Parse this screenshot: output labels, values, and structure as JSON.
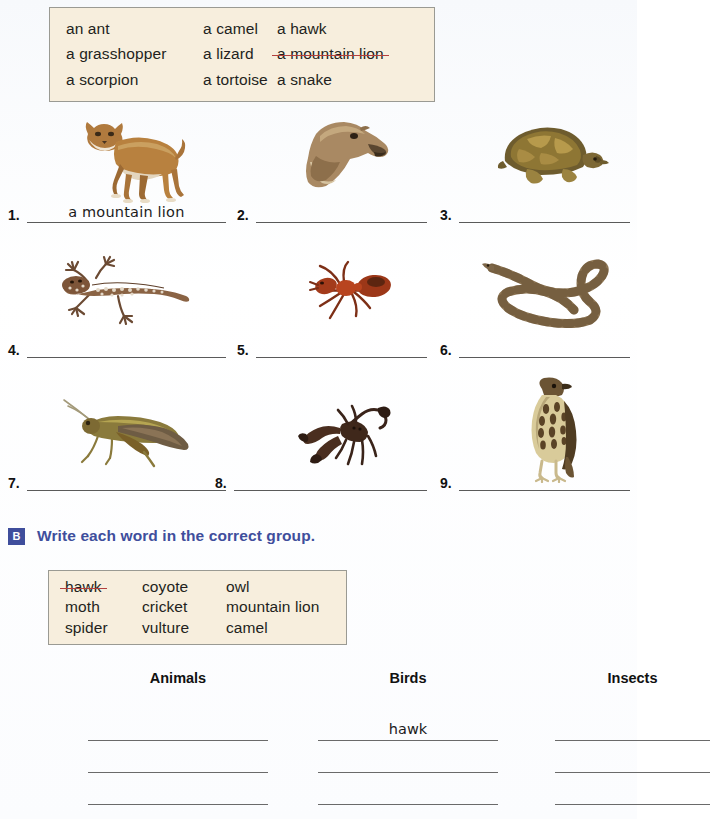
{
  "word_bank_a": {
    "name": "word-bank-a",
    "words": [
      {
        "text": "an ant",
        "struck": false
      },
      {
        "text": "a camel",
        "struck": false
      },
      {
        "text": "a hawk",
        "struck": false
      },
      {
        "text": "a grasshopper",
        "struck": false
      },
      {
        "text": "a lizard",
        "struck": false
      },
      {
        "text": "a mountain lion",
        "struck": true
      },
      {
        "text": "a scorpion",
        "struck": false
      },
      {
        "text": "a tortoise",
        "struck": false
      },
      {
        "text": "a snake",
        "struck": false
      }
    ]
  },
  "picture_items": [
    {
      "number": "1.",
      "animal": "mountain-lion",
      "answer": "a mountain lion"
    },
    {
      "number": "2.",
      "animal": "camel",
      "answer": ""
    },
    {
      "number": "3.",
      "animal": "tortoise",
      "answer": ""
    },
    {
      "number": "4.",
      "animal": "lizard",
      "answer": ""
    },
    {
      "number": "5.",
      "animal": "ant",
      "answer": ""
    },
    {
      "number": "6.",
      "animal": "snake",
      "answer": ""
    },
    {
      "number": "7.",
      "animal": "grasshopper",
      "answer": ""
    },
    {
      "number": "8.",
      "animal": "scorpion",
      "answer": ""
    },
    {
      "number": "9.",
      "animal": "hawk",
      "answer": ""
    }
  ],
  "section_b": {
    "badge": "B",
    "title": "Write each word in the correct group.",
    "word_bank_b": {
      "words": [
        {
          "text": "hawk",
          "struck": true
        },
        {
          "text": "coyote",
          "struck": false
        },
        {
          "text": "owl",
          "struck": false
        },
        {
          "text": "moth",
          "struck": false
        },
        {
          "text": "cricket",
          "struck": false
        },
        {
          "text": "mountain lion",
          "struck": false
        },
        {
          "text": "spider",
          "struck": false
        },
        {
          "text": "vulture",
          "struck": false
        },
        {
          "text": "camel",
          "struck": false
        }
      ]
    },
    "categories": [
      {
        "title": "Animals",
        "answers": [
          "",
          "",
          ""
        ]
      },
      {
        "title": "Birds",
        "answers": [
          "hawk",
          "",
          ""
        ]
      },
      {
        "title": "Insects",
        "answers": [
          "",
          "",
          ""
        ]
      }
    ]
  },
  "colors": {
    "wordbox_bg": "#f7eedd",
    "wordbox_border": "#9a9a93",
    "strike_red": "#b2403f",
    "heading_blue": "#3f4e9c",
    "rule_gray": "#5a5a5a"
  }
}
